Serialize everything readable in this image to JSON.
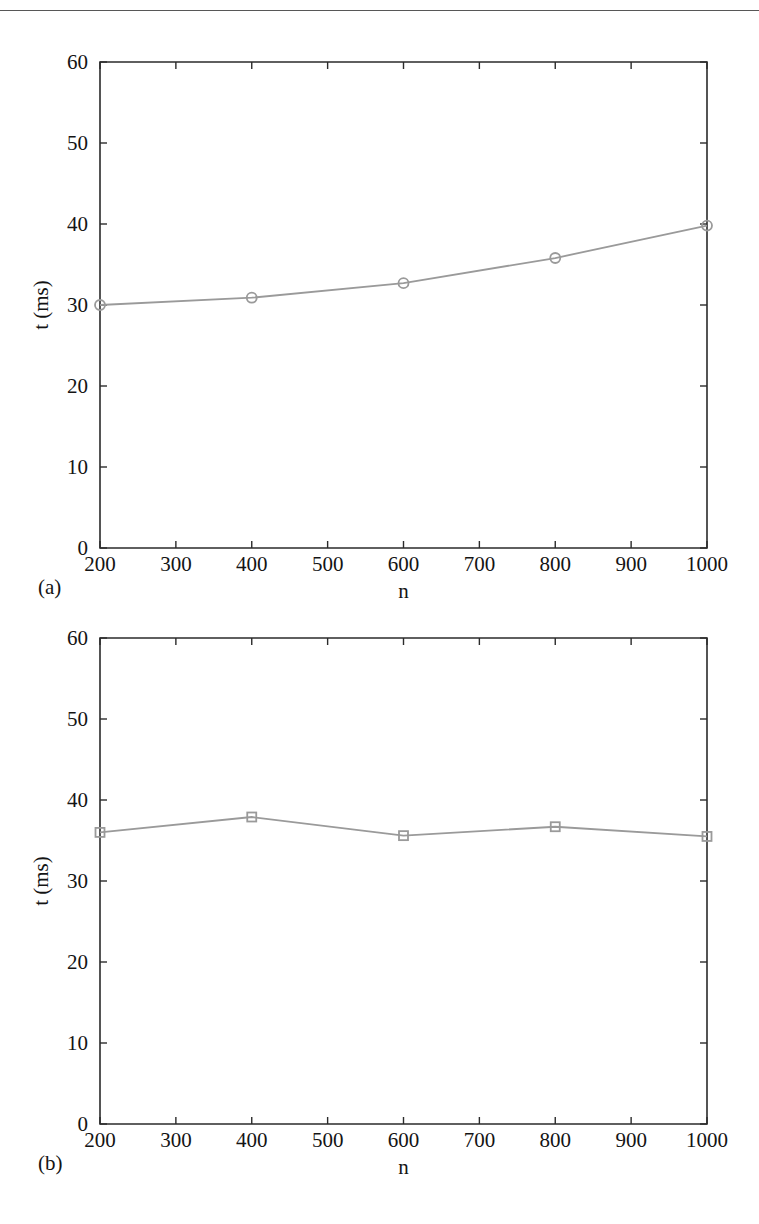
{
  "page": {
    "rule_color": "#3a3a3a",
    "background": "#ffffff"
  },
  "style": {
    "series_color": "#9a9a9a",
    "axis_color": "#2b2b2b",
    "text_color": "#141414"
  },
  "figure": {
    "panels": [
      {
        "key": "a",
        "panel_label": "(a)",
        "marker": "circle"
      },
      {
        "key": "b",
        "panel_label": "(b)",
        "marker": "square"
      }
    ]
  },
  "chart_data": [
    {
      "type": "line",
      "title": "",
      "panel_label": "(a)",
      "xlabel": "n",
      "ylabel": "t (ms)",
      "x": [
        200,
        400,
        600,
        800,
        1000
      ],
      "values": [
        30.0,
        30.9,
        32.7,
        35.8,
        39.8
      ],
      "series": [
        {
          "name": "t (ms)",
          "marker": "circle",
          "color": "#9a9a9a",
          "values": [
            30.0,
            30.9,
            32.7,
            35.8,
            39.8
          ]
        }
      ],
      "xlim": [
        200,
        1000
      ],
      "ylim": [
        0,
        60
      ],
      "xticks": [
        200,
        300,
        400,
        500,
        600,
        700,
        800,
        900,
        1000
      ],
      "xticklabels": [
        "200",
        "300",
        "400",
        "500",
        "600",
        "700",
        "800",
        "900",
        "1000"
      ],
      "yticks": [
        0,
        10,
        20,
        30,
        40,
        50,
        60
      ],
      "yticklabels": [
        "0",
        "10",
        "20",
        "30",
        "40",
        "50",
        "60"
      ],
      "grid": false,
      "legend": null
    },
    {
      "type": "line",
      "title": "",
      "panel_label": "(b)",
      "xlabel": "n",
      "ylabel": "t (ms)",
      "x": [
        200,
        400,
        600,
        800,
        1000
      ],
      "values": [
        36.0,
        37.9,
        35.6,
        36.7,
        35.5
      ],
      "series": [
        {
          "name": "t (ms)",
          "marker": "square",
          "color": "#9a9a9a",
          "values": [
            36.0,
            37.9,
            35.6,
            36.7,
            35.5
          ]
        }
      ],
      "xlim": [
        200,
        1000
      ],
      "ylim": [
        0,
        60
      ],
      "xticks": [
        200,
        300,
        400,
        500,
        600,
        700,
        800,
        900,
        1000
      ],
      "xticklabels": [
        "200",
        "300",
        "400",
        "500",
        "600",
        "700",
        "800",
        "900",
        "1000"
      ],
      "yticks": [
        0,
        10,
        20,
        30,
        40,
        50,
        60
      ],
      "yticklabels": [
        "0",
        "10",
        "20",
        "30",
        "40",
        "50",
        "60"
      ],
      "grid": false,
      "legend": null
    }
  ]
}
